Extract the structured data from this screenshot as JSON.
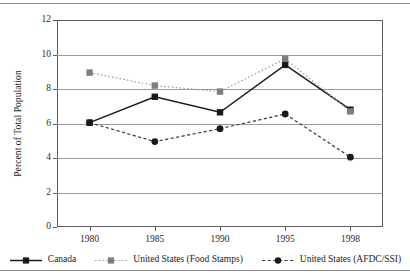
{
  "figure": {
    "width": 410,
    "height": 280,
    "has_top_rule": true,
    "has_bottom_rule": true
  },
  "chart_data": {
    "type": "line",
    "title": "",
    "subtitle": "",
    "xlabel": "",
    "ylabel": "Percent of Total Population",
    "categories": [
      "1980",
      "1985",
      "1990",
      "1995",
      "1998"
    ],
    "ylim": [
      0,
      12
    ],
    "ytick_values": [
      0,
      2,
      4,
      6,
      8,
      10,
      12
    ],
    "ytick_labels": [
      "0",
      "2",
      "4",
      "6",
      "8",
      "10",
      "12"
    ],
    "grid": true,
    "grid_axis": "y",
    "legend_position": "bottom",
    "series": [
      {
        "name": "Canada",
        "values": [
          6.05,
          7.55,
          6.65,
          9.4,
          6.8
        ],
        "color": "#1a1a1a",
        "line_style": "solid",
        "marker": "square",
        "marker_color": "#1a1a1a"
      },
      {
        "name": "United States (Food Stamps)",
        "values": [
          8.95,
          8.2,
          7.85,
          9.75,
          6.7
        ],
        "color": "#9b9b9b",
        "line_style": "dotted",
        "marker": "square",
        "marker_color": "#7d7d7d"
      },
      {
        "name": "United States (AFDC/SSI)",
        "values": [
          6.05,
          4.95,
          5.7,
          6.55,
          4.05
        ],
        "color": "#3a3a3a",
        "line_style": "dashed",
        "marker": "circle",
        "marker_color": "#1a1a1a"
      }
    ]
  },
  "colors": {
    "background": "#ffffff",
    "axis": "#5c5c62",
    "gridline": "#9a9a9f",
    "rule": "#8c8c92",
    "text": "#1a1a1a"
  }
}
